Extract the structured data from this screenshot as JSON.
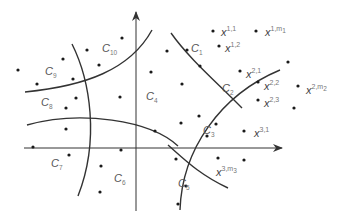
{
  "diagram": {
    "title": "",
    "axes": {
      "origin": [
        136,
        148
      ],
      "x_axis": {
        "from": [
          24,
          148
        ],
        "to": [
          282,
          148
        ],
        "arrow": true
      },
      "y_axis": {
        "from": [
          136,
          211
        ],
        "to": [
          136,
          12
        ],
        "arrow": true
      }
    },
    "colors": {
      "line": "#333333",
      "dot": "#1a1a1a",
      "label": "#555555"
    },
    "cluster_labels": [
      {
        "text": "C",
        "sub": "1",
        "x": 191,
        "y": 52
      },
      {
        "text": "C",
        "sub": "2",
        "x": 222,
        "y": 92
      },
      {
        "text": "C",
        "sub": "3",
        "x": 203,
        "y": 134
      },
      {
        "text": "C",
        "sub": "4",
        "x": 146,
        "y": 100
      },
      {
        "text": "C",
        "sub": "5",
        "x": 178,
        "y": 187
      },
      {
        "text": "C",
        "sub": "6",
        "x": 114,
        "y": 182
      },
      {
        "text": "C",
        "sub": "7",
        "x": 51,
        "y": 167
      },
      {
        "text": "C",
        "sub": "8",
        "x": 41,
        "y": 106
      },
      {
        "text": "C",
        "sub": "9",
        "x": 45,
        "y": 75
      },
      {
        "text": "C",
        "sub": "10",
        "x": 102,
        "y": 52
      }
    ],
    "point_labels": [
      {
        "base": "x",
        "sup": "1,1",
        "x": 218,
        "y": 32
      },
      {
        "base": "x",
        "sup": "1,m",
        "sub": "1",
        "x": 262,
        "y": 32
      },
      {
        "base": "x",
        "sup": "1,2",
        "x": 222,
        "y": 48
      },
      {
        "base": "x",
        "sup": "2,1",
        "x": 243,
        "y": 74
      },
      {
        "base": "x",
        "sup": "2,2",
        "x": 261,
        "y": 86
      },
      {
        "base": "x",
        "sup": "2,3",
        "x": 261,
        "y": 103
      },
      {
        "base": "x",
        "sup": "2,m",
        "sub": "2",
        "x": 303,
        "y": 90
      },
      {
        "base": "x",
        "sup": "3,1",
        "x": 251,
        "y": 133
      },
      {
        "base": "x",
        "sup": "3,m",
        "sub": "3",
        "x": 213,
        "y": 172
      }
    ],
    "points": [
      [
        122,
        38
      ],
      [
        167,
        51
      ],
      [
        187,
        50
      ],
      [
        213,
        31
      ],
      [
        256,
        31
      ],
      [
        219,
        46
      ],
      [
        240,
        71
      ],
      [
        258,
        82
      ],
      [
        258,
        100
      ],
      [
        298,
        86
      ],
      [
        288,
        62
      ],
      [
        294,
        108
      ],
      [
        200,
        66
      ],
      [
        182,
        84
      ],
      [
        181,
        123
      ],
      [
        216,
        124
      ],
      [
        199,
        116
      ],
      [
        207,
        136
      ],
      [
        244,
        131
      ],
      [
        176,
        159
      ],
      [
        218,
        158
      ],
      [
        244,
        160
      ],
      [
        186,
        186
      ],
      [
        178,
        204
      ],
      [
        87,
        50
      ],
      [
        63,
        59
      ],
      [
        99,
        65
      ],
      [
        18,
        70
      ],
      [
        37,
        84
      ],
      [
        73,
        79
      ],
      [
        76,
        98
      ],
      [
        66,
        108
      ],
      [
        120,
        97
      ],
      [
        151,
        72
      ],
      [
        155,
        131
      ],
      [
        66,
        129
      ],
      [
        33,
        147
      ],
      [
        69,
        155
      ],
      [
        121,
        150
      ],
      [
        101,
        166
      ],
      [
        100,
        192
      ]
    ],
    "curves": [
      {
        "name": "boundary-c9-c10",
        "d": "M 25 92 C 85 86, 130 70, 152 30"
      },
      {
        "name": "boundary-c1-c2-upper",
        "d": "M 171 33 C 190 60, 220 85, 242 108"
      },
      {
        "name": "boundary-c2-c3-arc",
        "d": "M 180 210 C 182 150, 220 95, 280 70"
      },
      {
        "name": "boundary-c8-c9-left",
        "d": "M 72 44 C 90 80, 100 140, 78 196"
      },
      {
        "name": "boundary-c4-c3-lower",
        "d": "M 27 125 C 80 110, 150 120, 178 146"
      },
      {
        "name": "boundary-c5-c3-lower",
        "d": "M 168 145 C 185 160, 200 175, 228 188"
      }
    ]
  }
}
